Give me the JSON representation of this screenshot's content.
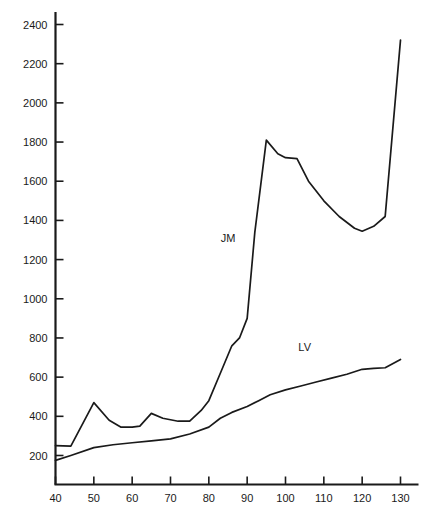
{
  "chart_data": {
    "type": "line",
    "title": "",
    "xlabel": "",
    "ylabel": "",
    "xlim": [
      40,
      130
    ],
    "ylim": [
      0,
      2450
    ],
    "grid": false,
    "legend": "inline-labels",
    "xticks": [
      40,
      50,
      60,
      70,
      80,
      90,
      100,
      110,
      120,
      130
    ],
    "yticks": [
      200,
      400,
      600,
      800,
      1000,
      1200,
      1400,
      1600,
      1800,
      2000,
      2200,
      2400
    ],
    "series": [
      {
        "name": "JM",
        "label": "JM",
        "label_x": 85,
        "label_y": 1290,
        "x": [
          40,
          44,
          50,
          54,
          57,
          60,
          62,
          65,
          68,
          72,
          75,
          78,
          80,
          83,
          86,
          88,
          90,
          92,
          95,
          98,
          100,
          103,
          106,
          110,
          114,
          118,
          120,
          123,
          126,
          130
        ],
        "y": [
          250,
          248,
          470,
          380,
          345,
          345,
          350,
          415,
          390,
          375,
          375,
          430,
          480,
          620,
          760,
          800,
          900,
          1340,
          1810,
          1740,
          1720,
          1715,
          1600,
          1500,
          1420,
          1360,
          1345,
          1370,
          1420,
          2320
        ]
      },
      {
        "name": "LV",
        "label": "LV",
        "label_x": 105,
        "label_y": 735,
        "x": [
          40,
          44,
          50,
          55,
          60,
          65,
          70,
          75,
          80,
          83,
          86,
          90,
          93,
          96,
          100,
          104,
          108,
          112,
          116,
          120,
          123,
          126,
          130
        ],
        "y": [
          175,
          200,
          240,
          255,
          265,
          275,
          285,
          310,
          345,
          390,
          420,
          450,
          480,
          510,
          535,
          555,
          575,
          595,
          615,
          640,
          645,
          648,
          690
        ]
      }
    ]
  }
}
